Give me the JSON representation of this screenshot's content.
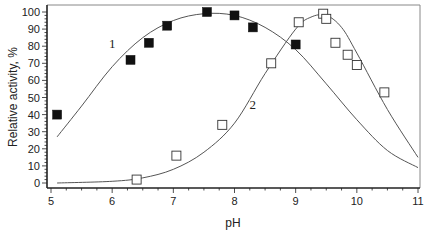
{
  "chart_data": {
    "type": "scatter",
    "title": "",
    "xlabel": "pH",
    "ylabel": "Relative activity, %",
    "xlim": [
      5,
      11
    ],
    "ylim": [
      0,
      100
    ],
    "x_ticks": [
      5,
      6,
      7,
      8,
      9,
      10,
      11
    ],
    "y_ticks": [
      0,
      10,
      20,
      30,
      40,
      50,
      60,
      70,
      80,
      90,
      100
    ],
    "grid": false,
    "legend": "none (curves labeled inline with '1' and '2')",
    "series": [
      {
        "name": "1",
        "marker": "filled-square",
        "points": [
          {
            "x": 5.1,
            "y": 40
          },
          {
            "x": 6.3,
            "y": 72
          },
          {
            "x": 6.6,
            "y": 82
          },
          {
            "x": 6.9,
            "y": 92
          },
          {
            "x": 7.55,
            "y": 100
          },
          {
            "x": 8.0,
            "y": 98
          },
          {
            "x": 8.3,
            "y": 91
          },
          {
            "x": 9.0,
            "y": 81
          }
        ],
        "fit_curve": [
          {
            "x": 5.1,
            "y": 27
          },
          {
            "x": 5.5,
            "y": 45
          },
          {
            "x": 6.0,
            "y": 68
          },
          {
            "x": 6.5,
            "y": 85
          },
          {
            "x": 7.0,
            "y": 95
          },
          {
            "x": 7.5,
            "y": 99
          },
          {
            "x": 8.0,
            "y": 98
          },
          {
            "x": 8.5,
            "y": 91
          },
          {
            "x": 9.0,
            "y": 78
          },
          {
            "x": 9.5,
            "y": 58
          },
          {
            "x": 10.0,
            "y": 37
          },
          {
            "x": 10.5,
            "y": 19
          },
          {
            "x": 11.0,
            "y": 9
          }
        ]
      },
      {
        "name": "2",
        "marker": "open-square",
        "points": [
          {
            "x": 6.4,
            "y": 2
          },
          {
            "x": 7.05,
            "y": 16
          },
          {
            "x": 7.8,
            "y": 34
          },
          {
            "x": 8.6,
            "y": 70
          },
          {
            "x": 9.05,
            "y": 94
          },
          {
            "x": 9.45,
            "y": 99
          },
          {
            "x": 9.5,
            "y": 96
          },
          {
            "x": 9.65,
            "y": 82
          },
          {
            "x": 9.85,
            "y": 75
          },
          {
            "x": 10.0,
            "y": 69
          },
          {
            "x": 10.45,
            "y": 53
          }
        ],
        "fit_curve": [
          {
            "x": 5.1,
            "y": 0
          },
          {
            "x": 6.0,
            "y": 1
          },
          {
            "x": 6.5,
            "y": 3
          },
          {
            "x": 7.0,
            "y": 8
          },
          {
            "x": 7.5,
            "y": 18
          },
          {
            "x": 8.0,
            "y": 35
          },
          {
            "x": 8.5,
            "y": 64
          },
          {
            "x": 9.0,
            "y": 90
          },
          {
            "x": 9.25,
            "y": 97
          },
          {
            "x": 9.5,
            "y": 98
          },
          {
            "x": 9.75,
            "y": 91
          },
          {
            "x": 10.0,
            "y": 76
          },
          {
            "x": 10.5,
            "y": 43
          },
          {
            "x": 11.0,
            "y": 15
          }
        ]
      }
    ],
    "annotations": [
      {
        "text": "1",
        "x": 6.0,
        "y": 82
      },
      {
        "text": "2",
        "x": 8.3,
        "y": 46
      }
    ]
  },
  "colors": {
    "axis": "#222222",
    "curve": "#555555",
    "marker": "#111111"
  }
}
